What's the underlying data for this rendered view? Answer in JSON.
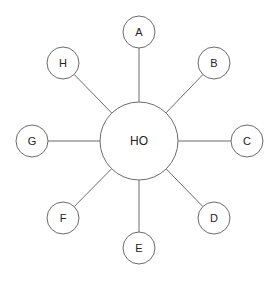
{
  "diagram": {
    "type": "star-network",
    "hub": {
      "label": "HO",
      "cx": 139,
      "cy": 141,
      "r": 39
    },
    "nodes": [
      {
        "label": "A",
        "cx": 139,
        "cy": 32,
        "r": 16
      },
      {
        "label": "B",
        "cx": 214,
        "cy": 63,
        "r": 16
      },
      {
        "label": "C",
        "cx": 247,
        "cy": 141,
        "r": 16
      },
      {
        "label": "D",
        "cx": 214,
        "cy": 218,
        "r": 16
      },
      {
        "label": "E",
        "cx": 139,
        "cy": 248,
        "r": 16
      },
      {
        "label": "F",
        "cx": 63,
        "cy": 218,
        "r": 16
      },
      {
        "label": "G",
        "cx": 32,
        "cy": 141,
        "r": 16
      },
      {
        "label": "H",
        "cx": 63,
        "cy": 63,
        "r": 16
      }
    ],
    "colors": {
      "stroke": "#6b6b6b",
      "text": "#222222",
      "background": "#ffffff"
    }
  }
}
